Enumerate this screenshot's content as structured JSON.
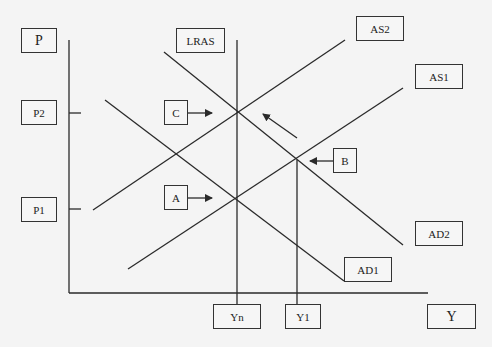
{
  "diagram": {
    "type": "AD-AS macroeconomic model",
    "axes": {
      "y_label": "P",
      "x_label": "Y"
    },
    "price_levels": [
      "P2",
      "P1"
    ],
    "output_levels": [
      "Yn",
      "Y1"
    ],
    "curves": {
      "lras": "LRAS",
      "as1": "AS1",
      "as2": "AS2",
      "ad1": "AD1",
      "ad2": "AD2"
    },
    "points": {
      "a": "A",
      "b": "B",
      "c": "C"
    },
    "colors": {
      "line": "#2a2a2a",
      "background": "#f4f4f4",
      "box_border": "#333333"
    }
  }
}
